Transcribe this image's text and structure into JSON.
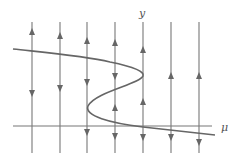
{
  "diagram": {
    "type": "phase-line bifurcation diagram",
    "axes": {
      "horizontal_label": "μ",
      "vertical_label": "y"
    },
    "colors": {
      "lines": "#777777",
      "curve": "#666666",
      "background": "#ffffff"
    },
    "vertical_lines": [
      {
        "x": 32,
        "arrows": [
          {
            "y": 32,
            "dir": "up"
          },
          {
            "y": 93,
            "dir": "down"
          }
        ]
      },
      {
        "x": 60,
        "arrows": [
          {
            "y": 36,
            "dir": "up"
          },
          {
            "y": 88,
            "dir": "down"
          }
        ]
      },
      {
        "x": 87,
        "arrows": [
          {
            "y": 41,
            "dir": "up"
          },
          {
            "y": 82,
            "dir": "down"
          },
          {
            "y": 132,
            "dir": "down"
          }
        ]
      },
      {
        "x": 115,
        "arrows": [
          {
            "y": 43,
            "dir": "up"
          },
          {
            "y": 76,
            "dir": "down"
          },
          {
            "y": 108,
            "dir": "up"
          },
          {
            "y": 136,
            "dir": "down"
          }
        ]
      },
      {
        "x": 143,
        "arrows": [
          {
            "y": 50,
            "dir": "up"
          },
          {
            "y": 102,
            "dir": "up"
          },
          {
            "y": 137,
            "dir": "down"
          }
        ]
      },
      {
        "x": 171,
        "arrows": [
          {
            "y": 76,
            "dir": "up"
          },
          {
            "y": 137,
            "dir": "down"
          }
        ]
      },
      {
        "x": 199,
        "arrows": [
          {
            "y": 76,
            "dir": "up"
          },
          {
            "y": 142,
            "dir": "down"
          }
        ]
      }
    ],
    "equilibrium_curve": "S-shaped curve with folds near μ at the 3rd and 5th phase lines"
  }
}
